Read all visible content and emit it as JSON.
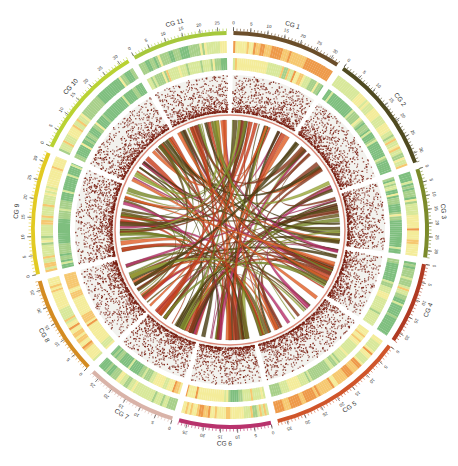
{
  "chart_data": {
    "type": "circos",
    "title": "",
    "center": [
      230,
      230
    ],
    "radii": {
      "ideogram_outer": 199,
      "ideogram_inner": 195,
      "label": 214,
      "heat1_outer": 189,
      "heat1_inner": 177,
      "heat2_outer": 172,
      "heat2_inner": 160,
      "scatter_outer": 155,
      "scatter_inner": 116,
      "link_radius": 110
    },
    "segments": [
      {
        "name": "CG 1",
        "start": 1,
        "end": 33,
        "color": "#6b4e2a",
        "ticks": [
          "0",
          "5",
          "10",
          "15",
          "20",
          "25",
          "30"
        ]
      },
      {
        "name": "CG 2",
        "start": 35,
        "end": 70,
        "color": "#4f4a20",
        "ticks": [
          "0",
          "5",
          "10",
          "15",
          "20",
          "25",
          "30"
        ]
      },
      {
        "name": "CG 3",
        "start": 72,
        "end": 98,
        "color": "#7b8a2a",
        "ticks": [
          "0",
          "5",
          "10",
          "15",
          "20",
          "25",
          "30"
        ]
      },
      {
        "name": "CG 4",
        "start": 100,
        "end": 124,
        "color": "#b03a22",
        "ticks": [
          "0",
          "5",
          "10",
          "15",
          "20"
        ]
      },
      {
        "name": "CG 5",
        "start": 126,
        "end": 166,
        "color": "#d0552a",
        "ticks": [
          "0",
          "5",
          "10",
          "15",
          "20",
          "25",
          "30",
          "35"
        ]
      },
      {
        "name": "CG 6",
        "start": 168,
        "end": 195,
        "color": "#b8326c",
        "ticks": [
          "0",
          "5",
          "10",
          "15",
          "20",
          "25"
        ]
      },
      {
        "name": "CG 7",
        "start": 197,
        "end": 224,
        "color": "#d9b3a8",
        "ticks": [
          "0",
          "5",
          "10",
          "15",
          "20",
          "25"
        ]
      },
      {
        "name": "CG 8",
        "start": 226,
        "end": 255,
        "color": "#d48c22",
        "ticks": [
          "0",
          "5",
          "10",
          "15",
          "20",
          "25"
        ]
      },
      {
        "name": "CG 9",
        "start": 257,
        "end": 293,
        "color": "#e2ca22",
        "ticks": [
          "0",
          "5",
          "10",
          "15",
          "20",
          "25",
          "30"
        ]
      },
      {
        "name": "CG 10",
        "start": 295,
        "end": 329,
        "color": "#b9d232",
        "ticks": [
          "0",
          "5",
          "10",
          "15",
          "20",
          "25",
          "30"
        ]
      },
      {
        "name": "CG 11",
        "start": 331,
        "end": 359,
        "color": "#a6c83c",
        "ticks": [
          "0",
          "5",
          "10",
          "15",
          "20",
          "25"
        ]
      }
    ],
    "tracks": [
      {
        "name": "heatmap-outer",
        "type": "heatmap",
        "palette": [
          "#7fbf7f",
          "#a8d08a",
          "#d8e89a",
          "#f4ec9a",
          "#f6c870",
          "#ee9a4a"
        ]
      },
      {
        "name": "heatmap-inner",
        "type": "heatmap",
        "palette": [
          "#7fbf7f",
          "#a8d08a",
          "#d8e89a",
          "#f4ec9a",
          "#f6c870",
          "#ee9a4a"
        ]
      },
      {
        "name": "scatter",
        "type": "scatter",
        "point_color": "#7a1f12",
        "background": "#f2f2ee"
      }
    ],
    "links": {
      "count_approx": 130,
      "colors": [
        "#5a4a18",
        "#6b5a20",
        "#4a3e14",
        "#c8401e",
        "#e0602a",
        "#9aa83a",
        "#b8326c",
        "#7a8a2a",
        "#8a3a20"
      ],
      "description": "ribbons connecting syntenic regions between CG chromosomes"
    },
    "legend": null,
    "grid": false
  }
}
